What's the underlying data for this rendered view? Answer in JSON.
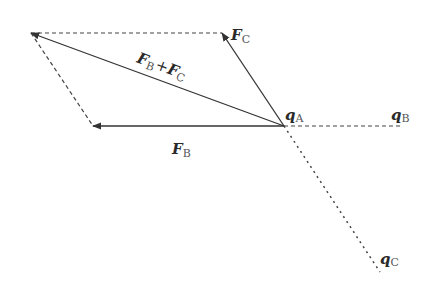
{
  "diagram": {
    "points": {
      "qA": {
        "x": 284,
        "y": 126
      },
      "qB": {
        "x": 403,
        "y": 126
      },
      "qC": {
        "x": 380,
        "y": 272
      },
      "FB_tip": {
        "x": 93,
        "y": 126
      },
      "FC_tip": {
        "x": 222,
        "y": 33
      },
      "sum_tip": {
        "x": 31,
        "y": 33
      }
    },
    "labels": {
      "FC": {
        "main": "F",
        "sub": "C"
      },
      "FB": {
        "main": "F",
        "sub": "B"
      },
      "sum": {
        "main1": "F",
        "sub1": "B",
        "plus": "+",
        "main2": "F",
        "sub2": "C"
      },
      "qA": {
        "main": "q",
        "sub": "A"
      },
      "qB": {
        "main": "q",
        "sub": "B"
      },
      "qC": {
        "main": "q",
        "sub": "C"
      }
    },
    "colors": {
      "line": "#333333",
      "dashed": "#444444"
    }
  }
}
